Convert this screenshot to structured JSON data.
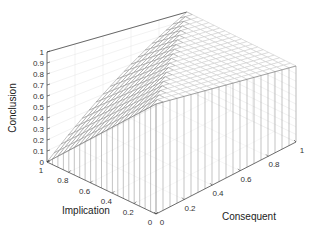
{
  "chart_data": {
    "type": "surface",
    "title": "",
    "xlabel": "Consequent",
    "ylabel": "Implication",
    "zlabel": "Conclusion",
    "x_ticks": [
      "0",
      "0.2",
      "0.4",
      "0.6",
      "0.8",
      "1"
    ],
    "y_ticks": [
      "0",
      "0.2",
      "0.4",
      "0.6",
      "0.8",
      "1"
    ],
    "z_ticks": [
      "0",
      "0.1",
      "0.2",
      "0.3",
      "0.4",
      "0.5",
      "0.6",
      "0.7",
      "0.8",
      "0.9",
      "1"
    ],
    "xlim": [
      0,
      1
    ],
    "ylim": [
      0,
      1
    ],
    "zlim": [
      0,
      1
    ],
    "grid": true,
    "function": "Conclusion = min(1, 1 - Implication + Consequent)",
    "grid_resolution": 21,
    "sample_points": [
      {
        "implication": 1,
        "consequent": 0,
        "conclusion": 0
      },
      {
        "implication": 1,
        "consequent": 0.5,
        "conclusion": 0.5
      },
      {
        "implication": 1,
        "consequent": 1,
        "conclusion": 1
      },
      {
        "implication": 0.5,
        "consequent": 0,
        "conclusion": 0.5
      },
      {
        "implication": 0.5,
        "consequent": 0.5,
        "conclusion": 1
      },
      {
        "implication": 0,
        "consequent": 0,
        "conclusion": 1
      },
      {
        "implication": 0,
        "consequent": 1,
        "conclusion": 1
      }
    ]
  }
}
